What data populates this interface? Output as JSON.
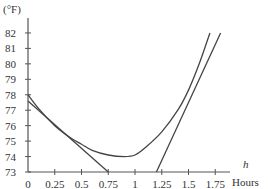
{
  "chart_data": {
    "type": "line",
    "title": "",
    "ylabel": "(°F)",
    "xlabel_var": "h",
    "xlabel": "Hours",
    "xlim": [
      0,
      1.85
    ],
    "ylim": [
      73,
      82.8
    ],
    "x_ticks": [
      "0",
      "0.25",
      "0.5",
      "0.75",
      "1",
      "1.25",
      "1.5",
      "1.75"
    ],
    "y_ticks": [
      "73",
      "74",
      "75",
      "76",
      "77",
      "78",
      "79",
      "80",
      "81",
      "82"
    ],
    "grid": false,
    "series": [
      {
        "name": "temperature curve",
        "x": [
          0,
          0.1,
          0.25,
          0.4,
          0.5,
          0.6,
          0.75,
          0.9,
          1.0,
          1.1,
          1.25,
          1.4,
          1.5,
          1.6,
          1.7
        ],
        "y": [
          78.0,
          77.1,
          76.0,
          75.2,
          74.8,
          74.4,
          74.1,
          74.0,
          74.1,
          74.6,
          75.6,
          77.0,
          78.3,
          80.0,
          82.0
        ]
      },
      {
        "name": "tangent line near h=0.3",
        "x": [
          0,
          0.75
        ],
        "y": [
          77.6,
          73.0
        ]
      },
      {
        "name": "tangent line near h=1.45",
        "x": [
          1.2,
          1.8
        ],
        "y": [
          73.0,
          82.0
        ]
      }
    ]
  }
}
